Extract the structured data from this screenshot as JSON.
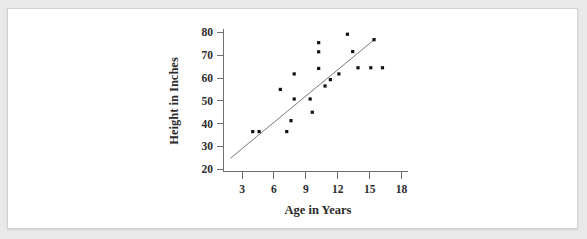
{
  "figure": {
    "background_color": "#e9e9e9",
    "card_color": "#ffffff",
    "border_color": "#d2d2d2"
  },
  "chart_data": {
    "type": "scatter",
    "title": "",
    "xlabel": "Age in Years",
    "ylabel": "Height in Inches",
    "xlim": [
      1.3,
      18.6
    ],
    "ylim": [
      19.0,
      81.5
    ],
    "xticks": [
      3,
      6,
      9,
      12,
      15,
      18
    ],
    "yticks": [
      20,
      30,
      40,
      50,
      60,
      70,
      80
    ],
    "xtick_labels": [
      "3",
      "6",
      "9",
      "12",
      "15",
      "18"
    ],
    "ytick_labels": [
      "20",
      "30",
      "40",
      "50",
      "60",
      "70",
      "80"
    ],
    "grid": false,
    "legend": false,
    "point_color": "#111111",
    "line_color": "#7a7a7a",
    "x": [
      4.0,
      4.6,
      6.6,
      7.2,
      7.6,
      7.9,
      9.4,
      9.6,
      10.2,
      10.2,
      10.2,
      10.6,
      11.0,
      11.3,
      11.4,
      12.1,
      12.9,
      13.4,
      13.9,
      15.1,
      15.4,
      16.2
    ],
    "y": [
      36.5,
      36.5,
      55.0,
      36.5,
      41.3,
      50.8,
      50.8,
      45.0,
      75.5,
      71.5,
      64.2,
      61.8,
      56.5,
      59.3,
      57.5,
      61.8,
      79.2,
      71.6,
      64.5,
      64.5,
      76.8,
      64.5
    ],
    "points": [
      {
        "x": 4.0,
        "y": 36.5
      },
      {
        "x": 4.6,
        "y": 36.5
      },
      {
        "x": 6.6,
        "y": 55.0
      },
      {
        "x": 7.2,
        "y": 36.5
      },
      {
        "x": 7.6,
        "y": 41.3
      },
      {
        "x": 7.9,
        "y": 50.8
      },
      {
        "x": 7.9,
        "y": 61.8
      },
      {
        "x": 9.4,
        "y": 50.8
      },
      {
        "x": 9.6,
        "y": 45.0
      },
      {
        "x": 10.2,
        "y": 75.5
      },
      {
        "x": 10.2,
        "y": 71.5
      },
      {
        "x": 10.2,
        "y": 64.2
      },
      {
        "x": 10.8,
        "y": 56.5
      },
      {
        "x": 11.3,
        "y": 59.3
      },
      {
        "x": 12.1,
        "y": 61.8
      },
      {
        "x": 12.9,
        "y": 79.2
      },
      {
        "x": 13.4,
        "y": 71.6
      },
      {
        "x": 13.9,
        "y": 64.5
      },
      {
        "x": 15.1,
        "y": 64.5
      },
      {
        "x": 15.4,
        "y": 76.8
      },
      {
        "x": 16.2,
        "y": 64.5
      }
    ],
    "fit_line": {
      "label": "least-squares trend line",
      "x_start": 1.9,
      "y_start": 24.8,
      "x_end": 15.6,
      "y_end": 77.5
    }
  }
}
